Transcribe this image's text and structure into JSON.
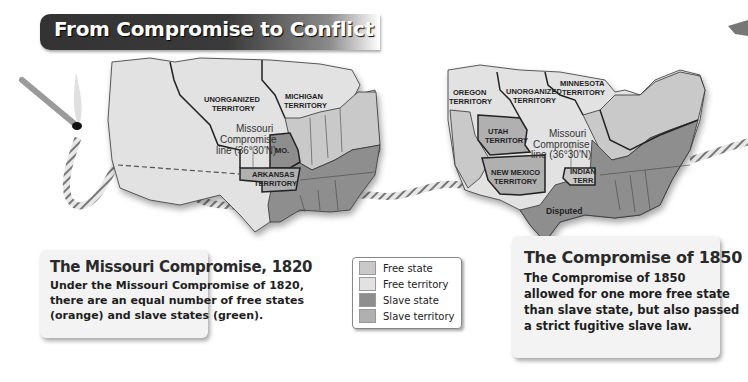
{
  "title": "From Compromise to Conflict",
  "colors": {
    "free_state": "#c9c9c9",
    "free_territory": "#e2e2e2",
    "slave_state": "#8e8e8e",
    "slave_territory": "#b0b0b0",
    "title_bar": "#333333"
  },
  "map_1820": {
    "labels": {
      "unorganized": [
        "UNORGANIZED",
        "TERRITORY"
      ],
      "michigan": [
        "MICHIGAN",
        "TERRITORY"
      ],
      "missouri_line": [
        "Missouri",
        "Compromise",
        "line (36°30'N)"
      ],
      "missouri": "MO.",
      "arkansas": [
        "ARKANSAS",
        "TERRITORY"
      ]
    }
  },
  "map_1850": {
    "labels": {
      "oregon": [
        "OREGON",
        "TERRITORY"
      ],
      "unorganized": [
        "UNORGANIZED",
        "TERRITORY"
      ],
      "minnesota": [
        "MINNESOTA",
        "TERRITORY"
      ],
      "utah": [
        "UTAH",
        "TERRITORY"
      ],
      "new_mexico": [
        "NEW MEXICO",
        "TERRITORY"
      ],
      "missouri_line": [
        "Missouri",
        "Compromise",
        "line (36°30'N)"
      ],
      "indian": [
        "INDIAN",
        "TERR."
      ],
      "disputed": "Disputed"
    }
  },
  "caption_1820": {
    "title": "The Missouri Compromise, 1820",
    "lines": [
      "Under the Missouri Compromise of 1820,",
      "there are an equal number of free states",
      "(orange) and slave states (green)."
    ]
  },
  "caption_1850": {
    "title": "The Compromise of 1850",
    "lines": [
      "The Compromise of 1850",
      "allowed for one more free state",
      "than slave state, but also passed",
      "a strict fugitive slave law."
    ]
  },
  "legend": {
    "items": [
      {
        "label": "Free state",
        "key": "free_state"
      },
      {
        "label": "Free territory",
        "key": "free_territory"
      },
      {
        "label": "Slave state",
        "key": "slave_state"
      },
      {
        "label": "Slave territory",
        "key": "slave_territory"
      }
    ]
  }
}
